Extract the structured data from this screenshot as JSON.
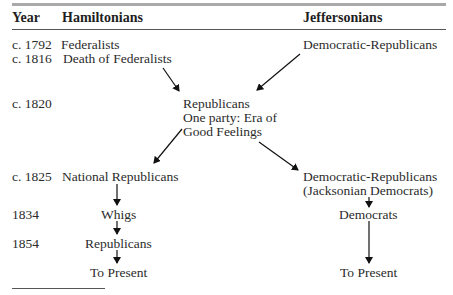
{
  "header": {
    "year": "Year",
    "hamiltonians": "Hamiltonians",
    "jeffersonians": "Jeffersonians"
  },
  "rows": [
    {
      "year": "c. 1792",
      "left": "Federalists",
      "right": "Democratic-Republicans"
    },
    {
      "year": "c. 1816",
      "left": "Death of Federalists"
    },
    {
      "year": "c. 1820",
      "center": [
        "Republicans",
        "One party: Era of",
        "Good Feelings"
      ]
    },
    {
      "year": "c. 1825",
      "left": "National Republicans",
      "right": [
        "Democratic-Republicans",
        "(Jacksonian Democrats)"
      ]
    },
    {
      "year": "1834",
      "left": "Whigs",
      "right": "Democrats"
    },
    {
      "year": "1854",
      "left": "Republicans"
    },
    {
      "year": "",
      "left": "To Present",
      "right": "To Present"
    }
  ],
  "colors": {
    "text": "#2b2b2b",
    "top_rule": "#a9a9a9",
    "arrow": "#111111"
  }
}
